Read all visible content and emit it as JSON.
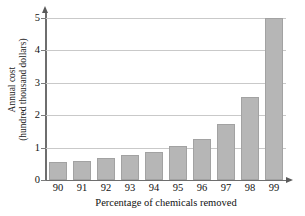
{
  "chart_data": {
    "type": "bar",
    "title": "",
    "xlabel": "Percentage of chemicals removed",
    "ylabel": "Annual cost (hundred thousand dollars)",
    "ylabel_line1": "Annual cost",
    "ylabel_line2": "(hundred thousand dollars)",
    "categories": [
      "90",
      "91",
      "92",
      "93",
      "94",
      "95",
      "96",
      "97",
      "98",
      "99"
    ],
    "values": [
      0.55,
      0.6,
      0.67,
      0.76,
      0.88,
      1.05,
      1.28,
      1.72,
      2.55,
      5.0
    ],
    "ylim": [
      0,
      5
    ],
    "yticks": [
      0,
      1,
      2,
      3,
      4,
      5
    ],
    "ytick_labels": [
      "0",
      "1",
      "2",
      "3",
      "4",
      "5"
    ],
    "grid": true,
    "legend": "none",
    "bar_color": "#b6b6b6",
    "bar_border_color": "#a2a2a2",
    "grid_color": "#c9c9c9",
    "axis_color": "#6e6e6e",
    "text_color": "#111111"
  }
}
